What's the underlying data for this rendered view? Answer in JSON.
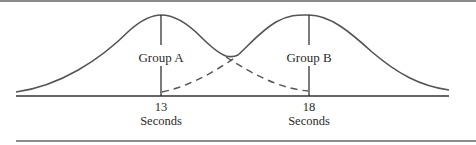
{
  "figure": {
    "groups": [
      {
        "label": "Group A",
        "mean_label": "13",
        "unit_label": "Seconds"
      },
      {
        "label": "Group B",
        "mean_label": "18",
        "unit_label": "Seconds"
      }
    ],
    "colors": {
      "curve": "#555555",
      "axis": "#333333",
      "rule": "#666666",
      "text": "#2a2a2a"
    }
  }
}
